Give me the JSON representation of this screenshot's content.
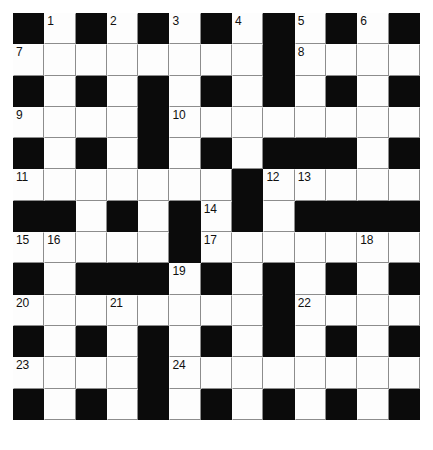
{
  "puzzle": {
    "title": "Crossword Grid",
    "rows": 13,
    "columns": 13,
    "cell_size_px": 31.3,
    "colors": {
      "block": "#0b0b0b",
      "cell": "#fdfdfd",
      "grid_line": "#8d8d8d",
      "number": "#101010",
      "background": "#ffffff"
    },
    "grid": [
      [
        "block",
        "open",
        "block",
        "open",
        "block",
        "open",
        "block",
        "open",
        "block",
        "open",
        "block",
        "open",
        "block"
      ],
      [
        "open",
        "open",
        "open",
        "open",
        "open",
        "open",
        "open",
        "open",
        "block",
        "open",
        "open",
        "open",
        "open"
      ],
      [
        "block",
        "open",
        "block",
        "open",
        "block",
        "open",
        "block",
        "open",
        "block",
        "open",
        "block",
        "open",
        "block"
      ],
      [
        "open",
        "open",
        "open",
        "open",
        "block",
        "open",
        "open",
        "open",
        "open",
        "open",
        "open",
        "open",
        "open"
      ],
      [
        "block",
        "open",
        "block",
        "open",
        "block",
        "open",
        "block",
        "open",
        "block",
        "block",
        "block",
        "open",
        "block"
      ],
      [
        "open",
        "open",
        "open",
        "open",
        "open",
        "open",
        "open",
        "block",
        "open",
        "open",
        "open",
        "open",
        "open"
      ],
      [
        "block",
        "block",
        "open",
        "block",
        "open",
        "block",
        "open",
        "block",
        "open",
        "block",
        "block",
        "block",
        "block"
      ],
      [
        "open",
        "open",
        "open",
        "open",
        "open",
        "block",
        "open",
        "open",
        "open",
        "open",
        "open",
        "open",
        "open"
      ],
      [
        "block",
        "open",
        "block",
        "block",
        "block",
        "open",
        "block",
        "open",
        "block",
        "open",
        "block",
        "open",
        "block"
      ],
      [
        "open",
        "open",
        "open",
        "open",
        "open",
        "open",
        "open",
        "open",
        "block",
        "open",
        "open",
        "open",
        "open"
      ],
      [
        "block",
        "open",
        "block",
        "open",
        "block",
        "open",
        "block",
        "open",
        "block",
        "open",
        "block",
        "open",
        "block"
      ],
      [
        "open",
        "open",
        "open",
        "open",
        "block",
        "open",
        "open",
        "open",
        "open",
        "open",
        "open",
        "open",
        "open"
      ],
      [
        "block",
        "open",
        "block",
        "open",
        "block",
        "open",
        "block",
        "open",
        "block",
        "open",
        "block",
        "open",
        "block"
      ]
    ],
    "numbers": [
      {
        "row": 1,
        "col": 2,
        "label": "1"
      },
      {
        "row": 1,
        "col": 4,
        "label": "2"
      },
      {
        "row": 1,
        "col": 6,
        "label": "3"
      },
      {
        "row": 1,
        "col": 8,
        "label": "4"
      },
      {
        "row": 1,
        "col": 10,
        "label": "5"
      },
      {
        "row": 1,
        "col": 12,
        "label": "6"
      },
      {
        "row": 2,
        "col": 1,
        "label": "7"
      },
      {
        "row": 2,
        "col": 10,
        "label": "8"
      },
      {
        "row": 4,
        "col": 1,
        "label": "9"
      },
      {
        "row": 4,
        "col": 6,
        "label": "10"
      },
      {
        "row": 6,
        "col": 1,
        "label": "11"
      },
      {
        "row": 6,
        "col": 9,
        "label": "12"
      },
      {
        "row": 6,
        "col": 10,
        "label": "13"
      },
      {
        "row": 7,
        "col": 7,
        "label": "14"
      },
      {
        "row": 8,
        "col": 1,
        "label": "15"
      },
      {
        "row": 8,
        "col": 2,
        "label": "16"
      },
      {
        "row": 8,
        "col": 7,
        "label": "17"
      },
      {
        "row": 8,
        "col": 12,
        "label": "18"
      },
      {
        "row": 9,
        "col": 6,
        "label": "19"
      },
      {
        "row": 10,
        "col": 1,
        "label": "20"
      },
      {
        "row": 10,
        "col": 4,
        "label": "21"
      },
      {
        "row": 10,
        "col": 10,
        "label": "22"
      },
      {
        "row": 12,
        "col": 1,
        "label": "23"
      },
      {
        "row": 12,
        "col": 6,
        "label": "24"
      }
    ]
  }
}
